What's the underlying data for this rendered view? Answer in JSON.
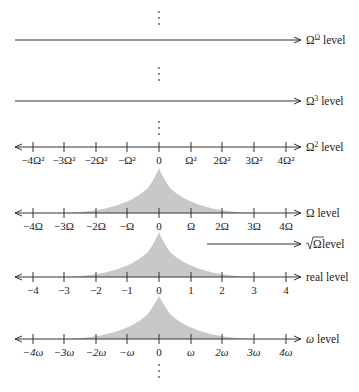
{
  "diagram": {
    "title": "",
    "colors": {
      "line": "#333333",
      "shade": "#c8c8c8",
      "background": "#ffffff"
    },
    "levels": [
      {
        "id": "omega-omega",
        "label_base": "Ω",
        "label_sup": "Ω",
        "label_suffix": " level",
        "type": "arrow-only"
      },
      {
        "id": "omega-cubed",
        "label_base": "Ω",
        "label_sup": "3",
        "label_suffix": " level",
        "type": "arrow-only"
      },
      {
        "id": "omega-squared",
        "label_base": "Ω",
        "label_sup": "2",
        "label_suffix": " level",
        "type": "number-line",
        "ticks": [
          "−4Ω²",
          "−3Ω²",
          "−2Ω²",
          "−Ω²",
          "0",
          "Ω²",
          "2Ω²",
          "3Ω²",
          "4Ω²"
        ]
      },
      {
        "id": "omega",
        "label": "Ω level",
        "type": "number-line",
        "shaded_peak": true,
        "ticks": [
          "−4Ω",
          "−3Ω",
          "−2Ω",
          "−Ω",
          "0",
          "Ω",
          "2Ω",
          "3Ω",
          "4Ω"
        ]
      },
      {
        "id": "sqrt-omega",
        "label_sqrt": "Ω",
        "label_suffix": " level",
        "type": "arrow-only-short"
      },
      {
        "id": "real",
        "label": "real level",
        "type": "number-line",
        "shaded_peak": true,
        "ticks": [
          "−4",
          "−3",
          "−2",
          "−1",
          "0",
          "1",
          "2",
          "3",
          "4"
        ]
      },
      {
        "id": "small-omega",
        "label_base": "ω",
        "label_suffix": " level",
        "type": "number-line",
        "shaded_peak": true,
        "ticks": [
          "−4ω",
          "−3ω",
          "−2ω",
          "−ω",
          "0",
          "ω",
          "2ω",
          "3ω",
          "4ω"
        ]
      }
    ],
    "ellipsis": "⋮"
  }
}
